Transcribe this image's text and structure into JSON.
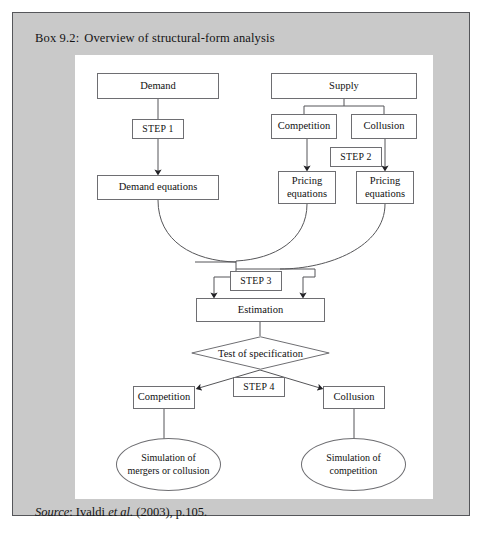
{
  "box": {
    "title_label": "Box 9.2:",
    "title_text": "Overview of structural-form analysis",
    "source_prefix": "Source",
    "source_sep": ": ",
    "source_author": "Ivaldi ",
    "source_etal": "et al.",
    "source_rest": " (2003), p.105.",
    "frame_color": "#c9c9c9",
    "border_color": "#55565a",
    "canvas_color": "#ffffff"
  },
  "diagram": {
    "type": "flowchart",
    "nodes": [
      {
        "id": "demand",
        "label": "Demand",
        "shape": "rect",
        "x": 22,
        "y": 18,
        "w": 122,
        "h": 26
      },
      {
        "id": "supply",
        "label": "Supply",
        "shape": "rect",
        "x": 196,
        "y": 18,
        "w": 146,
        "h": 26
      },
      {
        "id": "step1",
        "label": "STEP 1",
        "shape": "rect",
        "x": 57,
        "y": 64,
        "w": 52,
        "h": 20
      },
      {
        "id": "competition_top",
        "label": "Competition",
        "shape": "rect",
        "x": 196,
        "y": 59,
        "w": 66,
        "h": 25
      },
      {
        "id": "collusion_top",
        "label": "Collusion",
        "shape": "rect",
        "x": 276,
        "y": 59,
        "w": 66,
        "h": 25
      },
      {
        "id": "step2",
        "label": "STEP 2",
        "shape": "rect",
        "x": 255,
        "y": 92,
        "w": 52,
        "h": 20
      },
      {
        "id": "demand_equations",
        "label": "Demand equations",
        "shape": "rect",
        "x": 22,
        "y": 120,
        "w": 122,
        "h": 25
      },
      {
        "id": "pricing_eq_left",
        "label": "Pricing\nequations",
        "shape": "rect",
        "x": 203,
        "y": 116,
        "w": 58,
        "h": 33
      },
      {
        "id": "pricing_eq_right",
        "label": "Pricing\nequations",
        "shape": "rect",
        "x": 281,
        "y": 116,
        "w": 58,
        "h": 33
      },
      {
        "id": "step3",
        "label": "STEP 3",
        "shape": "rect",
        "x": 155,
        "y": 216,
        "w": 52,
        "h": 20
      },
      {
        "id": "estimation",
        "label": "Estimation",
        "shape": "rect",
        "x": 121,
        "y": 243,
        "w": 129,
        "h": 24
      },
      {
        "id": "test_spec",
        "label": "Test of specification",
        "shape": "diamond",
        "x": 116,
        "y": 281,
        "w": 139,
        "h": 34
      },
      {
        "id": "step4",
        "label": "STEP 4",
        "shape": "rect",
        "x": 158,
        "y": 322,
        "w": 52,
        "h": 20
      },
      {
        "id": "competition_bot",
        "label": "Competition",
        "shape": "rect",
        "x": 58,
        "y": 331,
        "w": 62,
        "h": 23
      },
      {
        "id": "collusion_bot",
        "label": "Collusion",
        "shape": "rect",
        "x": 248,
        "y": 331,
        "w": 62,
        "h": 23
      },
      {
        "id": "sim_mergers",
        "label": "Simulation of\nmergers or collusion",
        "shape": "ellipse",
        "x": 41,
        "y": 383,
        "w": 105,
        "h": 53
      },
      {
        "id": "sim_competition",
        "label": "Simulation of\ncompetition",
        "shape": "ellipse",
        "x": 226,
        "y": 383,
        "w": 105,
        "h": 53
      }
    ],
    "edges": [
      {
        "from": "demand",
        "to": "step1",
        "style": "line"
      },
      {
        "from": "step1",
        "to": "demand_equations",
        "style": "arrow"
      },
      {
        "from": "supply",
        "to": "competition_top",
        "style": "line"
      },
      {
        "from": "supply",
        "to": "collusion_top",
        "style": "line"
      },
      {
        "from": "competition_top",
        "to": "pricing_eq_left",
        "style": "arrow"
      },
      {
        "from": "collusion_top",
        "to": "pricing_eq_right",
        "style": "arrow"
      },
      {
        "from": "demand_equations",
        "to": "estimation",
        "style": "curve-arrow"
      },
      {
        "from": "pricing_eq_left",
        "to": "estimation",
        "style": "curve-arrow"
      },
      {
        "from": "pricing_eq_right",
        "to": "estimation",
        "style": "curve-arrow"
      },
      {
        "from": "estimation",
        "to": "test_spec",
        "style": "line"
      },
      {
        "from": "test_spec",
        "to": "competition_bot",
        "style": "diagonal-arrow"
      },
      {
        "from": "test_spec",
        "to": "collusion_bot",
        "style": "diagonal-arrow"
      },
      {
        "from": "competition_bot",
        "to": "sim_mergers",
        "style": "line"
      },
      {
        "from": "collusion_bot",
        "to": "sim_competition",
        "style": "line"
      }
    ],
    "line_color": "#555558"
  }
}
